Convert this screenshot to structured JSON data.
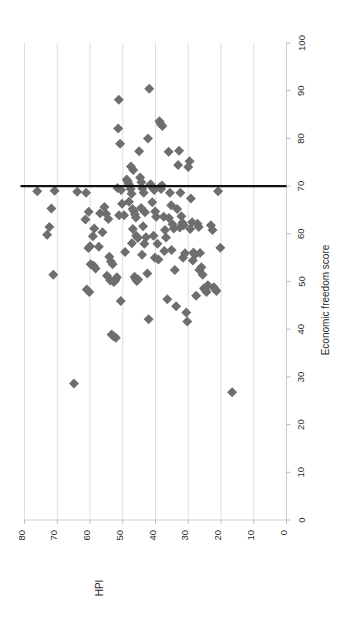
{
  "chart_data": {
    "type": "scatter",
    "title": "",
    "orientation": "rotated-90",
    "xlabel": "HPI",
    "ylabel": "Economic freedom score",
    "xlim": [
      0,
      80
    ],
    "ylim": [
      0,
      100
    ],
    "x_ticks": [
      80,
      70,
      60,
      50,
      40,
      30,
      20,
      10,
      0
    ],
    "y_ticks": [
      0,
      10,
      20,
      30,
      40,
      50,
      60,
      70,
      80,
      90,
      100
    ],
    "x_tick_direction": "descending-left-to-right",
    "grid": "vertical-gridlines-only",
    "legend": "none",
    "annotations": [
      {
        "type": "reference-line",
        "orientation": "horizontal",
        "value": 70,
        "axis": "Economic freedom score",
        "color": "#111111",
        "label": ""
      }
    ],
    "marker": {
      "shape": "diamond",
      "color": "#6e6e6e",
      "size": 5
    },
    "points": [
      {
        "x": 76.1,
        "y": 68.9
      },
      {
        "x": 71.8,
        "y": 65.3
      },
      {
        "x": 70.8,
        "y": 69.0
      },
      {
        "x": 72.4,
        "y": 61.4
      },
      {
        "x": 73.1,
        "y": 59.8
      },
      {
        "x": 71.2,
        "y": 51.4
      },
      {
        "x": 64.9,
        "y": 28.6
      },
      {
        "x": 63.9,
        "y": 68.8
      },
      {
        "x": 61.2,
        "y": 68.6
      },
      {
        "x": 61.4,
        "y": 63.0
      },
      {
        "x": 60.4,
        "y": 64.6
      },
      {
        "x": 59.1,
        "y": 59.5
      },
      {
        "x": 58.7,
        "y": 61.1
      },
      {
        "x": 60.0,
        "y": 57.4
      },
      {
        "x": 60.5,
        "y": 57.0
      },
      {
        "x": 59.8,
        "y": 53.6
      },
      {
        "x": 58.9,
        "y": 53.3
      },
      {
        "x": 58.3,
        "y": 52.7
      },
      {
        "x": 61.0,
        "y": 48.3
      },
      {
        "x": 60.2,
        "y": 47.8
      },
      {
        "x": 57.3,
        "y": 57.3
      },
      {
        "x": 56.9,
        "y": 64.3
      },
      {
        "x": 55.6,
        "y": 65.6
      },
      {
        "x": 55.1,
        "y": 64.2
      },
      {
        "x": 54.4,
        "y": 63.1
      },
      {
        "x": 56.2,
        "y": 60.3
      },
      {
        "x": 54.1,
        "y": 55.2
      },
      {
        "x": 53.6,
        "y": 54.2
      },
      {
        "x": 53.1,
        "y": 53.6
      },
      {
        "x": 54.8,
        "y": 51.2
      },
      {
        "x": 53.8,
        "y": 50.2
      },
      {
        "x": 52.7,
        "y": 49.9
      },
      {
        "x": 52.2,
        "y": 50.3
      },
      {
        "x": 51.8,
        "y": 50.9
      },
      {
        "x": 53.4,
        "y": 38.9
      },
      {
        "x": 52.8,
        "y": 38.5
      },
      {
        "x": 52.1,
        "y": 38.2
      },
      {
        "x": 51.2,
        "y": 88.1
      },
      {
        "x": 50.8,
        "y": 78.9
      },
      {
        "x": 51.4,
        "y": 82.1
      },
      {
        "x": 51.6,
        "y": 69.6
      },
      {
        "x": 50.5,
        "y": 69.2
      },
      {
        "x": 50.2,
        "y": 66.3
      },
      {
        "x": 51.1,
        "y": 63.9
      },
      {
        "x": 49.6,
        "y": 63.9
      },
      {
        "x": 49.3,
        "y": 56.2
      },
      {
        "x": 50.6,
        "y": 45.9
      },
      {
        "x": 48.8,
        "y": 71.4
      },
      {
        "x": 48.5,
        "y": 71.0
      },
      {
        "x": 48.2,
        "y": 70.5
      },
      {
        "x": 47.9,
        "y": 70.1
      },
      {
        "x": 47.6,
        "y": 69.4
      },
      {
        "x": 47.3,
        "y": 68.4
      },
      {
        "x": 48.1,
        "y": 66.7
      },
      {
        "x": 47.0,
        "y": 65.2
      },
      {
        "x": 46.6,
        "y": 64.8
      },
      {
        "x": 46.3,
        "y": 64.1
      },
      {
        "x": 46.0,
        "y": 63.4
      },
      {
        "x": 46.9,
        "y": 61.0
      },
      {
        "x": 45.9,
        "y": 59.6
      },
      {
        "x": 45.4,
        "y": 59.1
      },
      {
        "x": 47.2,
        "y": 58.0
      },
      {
        "x": 46.4,
        "y": 51.0
      },
      {
        "x": 46.1,
        "y": 50.6
      },
      {
        "x": 45.7,
        "y": 50.1
      },
      {
        "x": 45.3,
        "y": 50.4
      },
      {
        "x": 47.5,
        "y": 74.1
      },
      {
        "x": 46.8,
        "y": 73.4
      },
      {
        "x": 45.0,
        "y": 77.3
      },
      {
        "x": 44.7,
        "y": 71.8
      },
      {
        "x": 44.3,
        "y": 70.8
      },
      {
        "x": 44.0,
        "y": 69.5
      },
      {
        "x": 43.6,
        "y": 68.6
      },
      {
        "x": 44.4,
        "y": 65.4
      },
      {
        "x": 43.2,
        "y": 64.5
      },
      {
        "x": 43.8,
        "y": 61.6
      },
      {
        "x": 42.9,
        "y": 59.3
      },
      {
        "x": 43.4,
        "y": 57.9
      },
      {
        "x": 44.1,
        "y": 55.6
      },
      {
        "x": 42.5,
        "y": 51.7
      },
      {
        "x": 42.1,
        "y": 42.1
      },
      {
        "x": 41.9,
        "y": 90.4
      },
      {
        "x": 42.3,
        "y": 80.0
      },
      {
        "x": 41.5,
        "y": 70.4
      },
      {
        "x": 41.2,
        "y": 70.0
      },
      {
        "x": 40.8,
        "y": 69.6
      },
      {
        "x": 40.4,
        "y": 69.2
      },
      {
        "x": 41.0,
        "y": 66.6
      },
      {
        "x": 40.1,
        "y": 64.7
      },
      {
        "x": 39.8,
        "y": 63.6
      },
      {
        "x": 40.6,
        "y": 59.6
      },
      {
        "x": 39.4,
        "y": 57.9
      },
      {
        "x": 40.2,
        "y": 55.0
      },
      {
        "x": 39.1,
        "y": 54.6
      },
      {
        "x": 38.6,
        "y": 69.8
      },
      {
        "x": 38.3,
        "y": 69.4
      },
      {
        "x": 38.0,
        "y": 70.1
      },
      {
        "x": 38.8,
        "y": 83.6
      },
      {
        "x": 38.4,
        "y": 83.0
      },
      {
        "x": 37.9,
        "y": 82.6
      },
      {
        "x": 37.5,
        "y": 63.6
      },
      {
        "x": 37.1,
        "y": 60.8
      },
      {
        "x": 36.8,
        "y": 59.2
      },
      {
        "x": 37.3,
        "y": 56.4
      },
      {
        "x": 36.4,
        "y": 46.3
      },
      {
        "x": 36.0,
        "y": 77.2
      },
      {
        "x": 35.6,
        "y": 68.6
      },
      {
        "x": 35.2,
        "y": 66.0
      },
      {
        "x": 35.9,
        "y": 63.3
      },
      {
        "x": 34.8,
        "y": 62.0
      },
      {
        "x": 34.4,
        "y": 61.1
      },
      {
        "x": 35.1,
        "y": 56.6
      },
      {
        "x": 34.1,
        "y": 52.4
      },
      {
        "x": 33.7,
        "y": 44.8
      },
      {
        "x": 33.1,
        "y": 74.4
      },
      {
        "x": 32.8,
        "y": 77.4
      },
      {
        "x": 32.4,
        "y": 68.6
      },
      {
        "x": 33.4,
        "y": 65.2
      },
      {
        "x": 32.1,
        "y": 63.7
      },
      {
        "x": 31.8,
        "y": 62.3
      },
      {
        "x": 32.6,
        "y": 61.3
      },
      {
        "x": 31.4,
        "y": 61.8
      },
      {
        "x": 31.0,
        "y": 55.9
      },
      {
        "x": 31.6,
        "y": 55.0
      },
      {
        "x": 30.6,
        "y": 43.5
      },
      {
        "x": 30.3,
        "y": 41.6
      },
      {
        "x": 30.0,
        "y": 74.0
      },
      {
        "x": 29.6,
        "y": 75.2
      },
      {
        "x": 29.2,
        "y": 67.4
      },
      {
        "x": 28.8,
        "y": 62.4
      },
      {
        "x": 29.4,
        "y": 61.0
      },
      {
        "x": 28.4,
        "y": 56.1
      },
      {
        "x": 28.0,
        "y": 55.6
      },
      {
        "x": 28.6,
        "y": 54.4
      },
      {
        "x": 27.6,
        "y": 47.0
      },
      {
        "x": 27.2,
        "y": 62.1
      },
      {
        "x": 26.8,
        "y": 61.4
      },
      {
        "x": 26.4,
        "y": 56.0
      },
      {
        "x": 26.0,
        "y": 53.0
      },
      {
        "x": 26.6,
        "y": 52.4
      },
      {
        "x": 25.6,
        "y": 51.4
      },
      {
        "x": 25.2,
        "y": 48.6
      },
      {
        "x": 24.8,
        "y": 48.2
      },
      {
        "x": 24.4,
        "y": 47.8
      },
      {
        "x": 24.0,
        "y": 49.2
      },
      {
        "x": 23.1,
        "y": 61.8
      },
      {
        "x": 22.6,
        "y": 60.8
      },
      {
        "x": 22.2,
        "y": 48.8
      },
      {
        "x": 21.8,
        "y": 48.4
      },
      {
        "x": 21.4,
        "y": 48.0
      },
      {
        "x": 20.9,
        "y": 68.9
      },
      {
        "x": 20.2,
        "y": 57.1
      },
      {
        "x": 16.6,
        "y": 26.8
      }
    ]
  },
  "axes": {
    "x": {
      "name": "HPI",
      "title": "HPI",
      "tick_labels": [
        "80",
        "70",
        "60",
        "50",
        "40",
        "30",
        "20",
        "10",
        "0"
      ]
    },
    "y": {
      "name": "Economic freedom score",
      "title": "Economic freedom score",
      "tick_labels": [
        "0",
        "10",
        "20",
        "30",
        "40",
        "50",
        "60",
        "70",
        "80",
        "90",
        "100"
      ]
    }
  }
}
